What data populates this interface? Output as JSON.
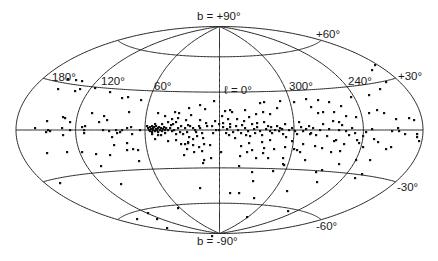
{
  "chart_data": {
    "type": "scatter",
    "projection": "hammer-aitoff (galactic coordinates, l increasing to the left)",
    "title": "",
    "xlabel": "galactic longitude ℓ",
    "ylabel": "galactic latitude b",
    "frame": {
      "cx": 219.5,
      "cy": 130,
      "a": 203.5,
      "b": 103.5
    },
    "meridians_deg": [
      0,
      60,
      120,
      180,
      240,
      300
    ],
    "parallels_deg": [
      -60,
      -30,
      0,
      30,
      60
    ],
    "labels": {
      "north_pole": "b = +90°",
      "south_pole": "b = -90°",
      "l0": "ℓ = 0°",
      "l60": "60°",
      "l120": "120°",
      "l180": "180°",
      "l240": "240°",
      "l300": "300°",
      "b_plus60": "+60°",
      "b_plus30": "+30°",
      "b_minus30": "-30°",
      "b_minus60": "-60°"
    },
    "label_positions": {
      "north_pole": [
        197,
        20
      ],
      "south_pole": [
        197,
        245
      ],
      "l0": [
        224,
        94
      ],
      "l60": [
        154,
        90
      ],
      "l120": [
        101,
        85
      ],
      "l180": [
        52,
        81
      ],
      "l240": [
        348,
        85
      ],
      "l300": [
        289,
        90
      ],
      "b_plus60": [
        316,
        38
      ],
      "b_plus30": [
        398,
        80
      ],
      "b_minus30": [
        397,
        191
      ],
      "b_minus60": [
        316,
        230
      ]
    },
    "points_px": [
      [
        35,
        128
      ],
      [
        47,
        121
      ],
      [
        48,
        130
      ],
      [
        46,
        132
      ],
      [
        50,
        131
      ],
      [
        63,
        117
      ],
      [
        63,
        135
      ],
      [
        67,
        152
      ],
      [
        62,
        128
      ],
      [
        65,
        118
      ],
      [
        70,
        122
      ],
      [
        70,
        130
      ],
      [
        84,
        130
      ],
      [
        84,
        133
      ],
      [
        85,
        126
      ],
      [
        82,
        127
      ],
      [
        92,
        113
      ],
      [
        99,
        122
      ],
      [
        103,
        130
      ],
      [
        104,
        116
      ],
      [
        107,
        120
      ],
      [
        109,
        131
      ],
      [
        112,
        137
      ],
      [
        114,
        145
      ],
      [
        116,
        130
      ],
      [
        117,
        133
      ],
      [
        120,
        132
      ],
      [
        122,
        130
      ],
      [
        127,
        128
      ],
      [
        127,
        143
      ],
      [
        127,
        150
      ],
      [
        129,
        112
      ],
      [
        131,
        127
      ],
      [
        132,
        134
      ],
      [
        133,
        149
      ],
      [
        140,
        130
      ],
      [
        139,
        161
      ],
      [
        147,
        126
      ],
      [
        148,
        128
      ],
      [
        149,
        130
      ],
      [
        150,
        127
      ],
      [
        150,
        131
      ],
      [
        151,
        129
      ],
      [
        152,
        126
      ],
      [
        152,
        132
      ],
      [
        153,
        128
      ],
      [
        153,
        130
      ],
      [
        154,
        127
      ],
      [
        155,
        131
      ],
      [
        156,
        129
      ],
      [
        156,
        126
      ],
      [
        157,
        130
      ],
      [
        158,
        128
      ],
      [
        158,
        132
      ],
      [
        159,
        127
      ],
      [
        160,
        130
      ],
      [
        161,
        128
      ],
      [
        162,
        131
      ],
      [
        163,
        129
      ],
      [
        164,
        127
      ],
      [
        165,
        130
      ],
      [
        166,
        128
      ],
      [
        155,
        124
      ],
      [
        158,
        135
      ],
      [
        162,
        124
      ],
      [
        165,
        133
      ],
      [
        168,
        130
      ],
      [
        170,
        128
      ],
      [
        172,
        131
      ],
      [
        171,
        125
      ],
      [
        174,
        130
      ],
      [
        176,
        134
      ],
      [
        178,
        128
      ],
      [
        180,
        132
      ],
      [
        176,
        122
      ],
      [
        175,
        112
      ],
      [
        179,
        113
      ],
      [
        183,
        134
      ],
      [
        185,
        128
      ],
      [
        187,
        132
      ],
      [
        189,
        137
      ],
      [
        190,
        126
      ],
      [
        191,
        115
      ],
      [
        193,
        139
      ],
      [
        195,
        130
      ],
      [
        197,
        136
      ],
      [
        199,
        126
      ],
      [
        172,
        119
      ],
      [
        185,
        144
      ],
      [
        184,
        155
      ],
      [
        187,
        149
      ],
      [
        188,
        142
      ],
      [
        194,
        152
      ],
      [
        196,
        132
      ],
      [
        200,
        120
      ],
      [
        202,
        133
      ],
      [
        203,
        138
      ],
      [
        205,
        109
      ],
      [
        206,
        123
      ],
      [
        204,
        144
      ],
      [
        210,
        145
      ],
      [
        211,
        158
      ],
      [
        204,
        160
      ],
      [
        216,
        130
      ],
      [
        213,
        133
      ],
      [
        219,
        130
      ],
      [
        223,
        127
      ],
      [
        226,
        133
      ],
      [
        227,
        129
      ],
      [
        229,
        135
      ],
      [
        230,
        127
      ],
      [
        233,
        132
      ],
      [
        236,
        126
      ],
      [
        235,
        138
      ],
      [
        238,
        130
      ],
      [
        241,
        133
      ],
      [
        242,
        125
      ],
      [
        245,
        128
      ],
      [
        248,
        131
      ],
      [
        250,
        136
      ],
      [
        252,
        124
      ],
      [
        254,
        129
      ],
      [
        255,
        133
      ],
      [
        257,
        127
      ],
      [
        260,
        131
      ],
      [
        262,
        135
      ],
      [
        264,
        122
      ],
      [
        266,
        129
      ],
      [
        268,
        126
      ],
      [
        270,
        131
      ],
      [
        271,
        127
      ],
      [
        272,
        133
      ],
      [
        275,
        130
      ],
      [
        277,
        126
      ],
      [
        279,
        131
      ],
      [
        280,
        128
      ],
      [
        282,
        129
      ],
      [
        283,
        134
      ],
      [
        285,
        124
      ],
      [
        286,
        137
      ],
      [
        289,
        130
      ],
      [
        292,
        128
      ],
      [
        295,
        131
      ],
      [
        297,
        134
      ],
      [
        299,
        122
      ],
      [
        301,
        127
      ],
      [
        303,
        131
      ],
      [
        306,
        129
      ],
      [
        309,
        126
      ],
      [
        311,
        133
      ],
      [
        313,
        128
      ],
      [
        316,
        135
      ],
      [
        318,
        113
      ],
      [
        320,
        130
      ],
      [
        323,
        124
      ],
      [
        327,
        136
      ],
      [
        329,
        129
      ],
      [
        333,
        121
      ],
      [
        336,
        140
      ],
      [
        339,
        130
      ],
      [
        342,
        125
      ],
      [
        346,
        131
      ],
      [
        349,
        135
      ],
      [
        352,
        128
      ],
      [
        355,
        133
      ],
      [
        359,
        143
      ],
      [
        363,
        147
      ],
      [
        366,
        132
      ],
      [
        369,
        113
      ],
      [
        372,
        129
      ],
      [
        378,
        142
      ],
      [
        384,
        113
      ],
      [
        391,
        147
      ],
      [
        396,
        119
      ],
      [
        398,
        128
      ],
      [
        399,
        131
      ],
      [
        405,
        134
      ],
      [
        409,
        118
      ],
      [
        414,
        120
      ],
      [
        417,
        134
      ],
      [
        417,
        137
      ],
      [
        419,
        141
      ],
      [
        240,
        156
      ],
      [
        257,
        123
      ],
      [
        263,
        153
      ],
      [
        283,
        158
      ],
      [
        283,
        164
      ],
      [
        214,
        101
      ],
      [
        232,
        112
      ],
      [
        245,
        110
      ],
      [
        260,
        103
      ],
      [
        264,
        102
      ],
      [
        294,
        102
      ],
      [
        311,
        107
      ],
      [
        323,
        112
      ],
      [
        334,
        112
      ],
      [
        339,
        122
      ],
      [
        351,
        97
      ],
      [
        369,
        95
      ],
      [
        372,
        70
      ],
      [
        375,
        65
      ],
      [
        386,
        82
      ],
      [
        380,
        89
      ],
      [
        222,
        116
      ],
      [
        225,
        111
      ],
      [
        230,
        110
      ],
      [
        215,
        121
      ],
      [
        228,
        119
      ],
      [
        186,
        120
      ],
      [
        178,
        118
      ],
      [
        200,
        105
      ],
      [
        158,
        113
      ],
      [
        165,
        116
      ],
      [
        189,
        108
      ],
      [
        141,
        100
      ],
      [
        128,
        97
      ],
      [
        122,
        98
      ],
      [
        110,
        92
      ],
      [
        95,
        88
      ],
      [
        80,
        89
      ],
      [
        75,
        91
      ],
      [
        68,
        79
      ],
      [
        58,
        89
      ],
      [
        76,
        80
      ],
      [
        82,
        81
      ],
      [
        221,
        152
      ],
      [
        239,
        166
      ],
      [
        252,
        172
      ],
      [
        253,
        181
      ],
      [
        230,
        193
      ],
      [
        239,
        193
      ],
      [
        254,
        198
      ],
      [
        273,
        171
      ],
      [
        284,
        165
      ],
      [
        316,
        172
      ],
      [
        317,
        182
      ],
      [
        287,
        191
      ],
      [
        288,
        211
      ],
      [
        247,
        217
      ],
      [
        212,
        236
      ],
      [
        188,
        143
      ],
      [
        202,
        151
      ],
      [
        203,
        163
      ],
      [
        200,
        188
      ],
      [
        178,
        208
      ],
      [
        148,
        213
      ],
      [
        157,
        219
      ],
      [
        137,
        219
      ],
      [
        167,
        228
      ],
      [
        121,
        184
      ],
      [
        110,
        155
      ],
      [
        138,
        150
      ],
      [
        101,
        166
      ],
      [
        96,
        154
      ],
      [
        82,
        152
      ],
      [
        60,
        183
      ],
      [
        47,
        153
      ],
      [
        246,
        135
      ],
      [
        249,
        143
      ],
      [
        252,
        150
      ],
      [
        262,
        142
      ],
      [
        264,
        148
      ],
      [
        270,
        140
      ],
      [
        292,
        141
      ],
      [
        310,
        134
      ],
      [
        300,
        152
      ],
      [
        305,
        160
      ],
      [
        322,
        170
      ],
      [
        340,
        151
      ],
      [
        355,
        178
      ],
      [
        362,
        174
      ],
      [
        370,
        160
      ],
      [
        356,
        160
      ],
      [
        339,
        164
      ],
      [
        377,
        110
      ],
      [
        392,
        131
      ],
      [
        356,
        117
      ],
      [
        346,
        116
      ],
      [
        341,
        106
      ],
      [
        329,
        102
      ],
      [
        318,
        100
      ],
      [
        306,
        99
      ],
      [
        280,
        101
      ],
      [
        277,
        108
      ],
      [
        270,
        114
      ],
      [
        263,
        112
      ],
      [
        256,
        114
      ],
      [
        249,
        117
      ],
      [
        244,
        121
      ],
      [
        237,
        119
      ],
      [
        230,
        124
      ],
      [
        223,
        123
      ],
      [
        219,
        124
      ],
      [
        212,
        126
      ],
      [
        207,
        126
      ],
      [
        200,
        128
      ],
      [
        193,
        128
      ],
      [
        188,
        125
      ],
      [
        181,
        126
      ],
      [
        173,
        124
      ],
      [
        168,
        122
      ],
      [
        161,
        135
      ],
      [
        155,
        139
      ],
      [
        152,
        134
      ],
      [
        168,
        141
      ],
      [
        176,
        140
      ],
      [
        181,
        144
      ],
      [
        193,
        145
      ],
      [
        199,
        147
      ],
      [
        241,
        146
      ],
      [
        247,
        152
      ],
      [
        256,
        158
      ],
      [
        268,
        158
      ],
      [
        274,
        149
      ],
      [
        285,
        147
      ],
      [
        294,
        149
      ],
      [
        297,
        150
      ],
      [
        303,
        144
      ],
      [
        315,
        146
      ],
      [
        322,
        148
      ],
      [
        331,
        152
      ],
      [
        334,
        141
      ],
      [
        344,
        144
      ],
      [
        357,
        140
      ],
      [
        363,
        136
      ],
      [
        374,
        139
      ],
      [
        386,
        149
      ]
    ]
  }
}
